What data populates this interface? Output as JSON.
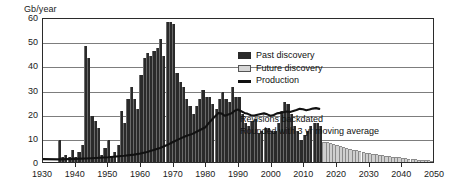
{
  "chart_data": {
    "type": "bar",
    "title": "",
    "subtitle": "",
    "ylabel": "Gb/year",
    "xlabel": "",
    "ylim": [
      0,
      60
    ],
    "xlim": [
      1930,
      2050
    ],
    "yticks": [
      0,
      10,
      20,
      30,
      40,
      50,
      60
    ],
    "xticks": [
      1930,
      1940,
      1950,
      1960,
      1970,
      1980,
      1990,
      2000,
      2010,
      2020,
      2030,
      2040,
      2050
    ],
    "grid": true,
    "legend_position": "upper-right",
    "legend": [
      "Past discovery",
      "Future discovery",
      "Production"
    ],
    "annotations": [
      "Revisions backdated",
      "Rounded with 3 yr moving average"
    ],
    "colors": {
      "past_discovery": "#2a2a2a",
      "future_discovery": "#cfcfcf",
      "production": "#111111",
      "gridline": "#7d7d7d",
      "axis": "#2b2b2b"
    },
    "series": [
      {
        "name": "Past discovery",
        "type": "bar",
        "x": [
          1935,
          1936,
          1937,
          1938,
          1939,
          1940,
          1941,
          1942,
          1943,
          1944,
          1945,
          1946,
          1947,
          1948,
          1949,
          1950,
          1951,
          1952,
          1953,
          1954,
          1955,
          1956,
          1957,
          1958,
          1959,
          1960,
          1961,
          1962,
          1963,
          1964,
          1965,
          1966,
          1967,
          1968,
          1969,
          1970,
          1971,
          1972,
          1973,
          1974,
          1975,
          1976,
          1977,
          1978,
          1979,
          1980,
          1981,
          1982,
          1983,
          1984,
          1985,
          1986,
          1987,
          1988,
          1989,
          1990,
          1991,
          1992,
          1993,
          1994,
          1995,
          1996,
          1997,
          1998,
          1999,
          2000,
          2001,
          2002,
          2003,
          2004,
          2005,
          2006,
          2007,
          2008,
          2009,
          2010,
          2011,
          2012,
          2013,
          2014,
          2015
        ],
        "values": [
          9,
          2,
          3,
          2,
          5,
          2,
          4,
          7,
          48,
          43,
          19,
          17,
          14,
          3,
          6,
          9,
          2,
          4,
          7,
          21,
          16,
          26,
          31,
          26,
          22,
          36,
          43,
          45,
          44,
          46,
          47,
          51,
          44,
          58,
          58,
          57,
          37,
          33,
          31,
          26,
          23,
          20,
          23,
          26,
          30,
          27,
          27,
          24,
          22,
          26,
          29,
          26,
          25,
          31,
          27,
          27,
          20,
          16,
          15,
          17,
          18,
          12,
          13,
          14,
          14,
          13,
          13,
          16,
          21,
          25,
          24,
          20,
          15,
          13,
          9,
          11,
          13,
          15,
          16,
          16,
          15
        ]
      },
      {
        "name": "Future discovery",
        "type": "bar",
        "x": [
          2016,
          2017,
          2018,
          2019,
          2020,
          2021,
          2022,
          2023,
          2024,
          2025,
          2026,
          2027,
          2028,
          2029,
          2030,
          2031,
          2032,
          2033,
          2034,
          2035,
          2036,
          2037,
          2038,
          2039,
          2040,
          2041,
          2042,
          2043,
          2044,
          2045,
          2046,
          2047,
          2048,
          2049,
          2050
        ],
        "values": [
          8.4,
          8.1,
          7.8,
          7.4,
          7.0,
          6.6,
          6.2,
          5.8,
          5.4,
          5.1,
          4.8,
          4.5,
          4.2,
          3.9,
          3.6,
          3.4,
          3.2,
          3.0,
          2.8,
          2.6,
          2.4,
          2.2,
          2.0,
          1.9,
          1.7,
          1.6,
          1.4,
          1.3,
          1.2,
          1.0,
          0.9,
          0.8,
          0.7,
          0.6,
          0.5
        ]
      },
      {
        "name": "Production",
        "type": "line",
        "x": [
          1930,
          1935,
          1940,
          1945,
          1950,
          1955,
          1958,
          1960,
          1962,
          1964,
          1966,
          1968,
          1970,
          1972,
          1974,
          1976,
          1978,
          1980,
          1981,
          1982,
          1983,
          1984,
          1985,
          1986,
          1987,
          1988,
          1989,
          1990,
          1991,
          1992,
          1993,
          1994,
          1995,
          1996,
          1997,
          1998,
          1999,
          2000,
          2001,
          2002,
          2003,
          2004,
          2005,
          2006,
          2007,
          2008,
          2009,
          2010,
          2011,
          2012,
          2013,
          2014,
          2015
        ],
        "values": [
          1.2,
          1.1,
          1.3,
          1.6,
          2.0,
          2.6,
          3.1,
          3.6,
          4.2,
          5.0,
          5.9,
          7.0,
          8.4,
          9.7,
          10.9,
          11.8,
          13.2,
          14.6,
          16.3,
          17.8,
          19.2,
          20.6,
          20.3,
          19.4,
          19.9,
          20.4,
          21.5,
          22.0,
          21.3,
          20.6,
          20.2,
          19.6,
          19.5,
          19.8,
          20.1,
          20.4,
          20.0,
          19.4,
          19.7,
          20.4,
          20.6,
          20.9,
          21.2,
          21.0,
          21.4,
          21.8,
          22.3,
          22.1,
          21.7,
          22.0,
          22.4,
          22.6,
          22.3
        ]
      }
    ]
  }
}
